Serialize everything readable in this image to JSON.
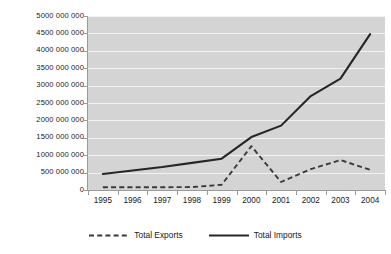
{
  "chart_data": {
    "type": "line",
    "title": "",
    "xlabel": "",
    "ylabel": "",
    "categories": [
      "1995",
      "1996",
      "1997",
      "1998",
      "1999",
      "2000",
      "2001",
      "2002",
      "2003",
      "2004"
    ],
    "series": [
      {
        "name": "Total Exports",
        "style": "dashed",
        "color": "#3a3a3a",
        "values": [
          80000000,
          80000000,
          80000000,
          85000000,
          150000000,
          1260000000,
          230000000,
          600000000,
          860000000,
          580000000
        ]
      },
      {
        "name": "Total Imports",
        "style": "solid",
        "color": "#262626",
        "values": [
          460000000,
          560000000,
          660000000,
          780000000,
          900000000,
          1520000000,
          1850000000,
          2700000000,
          3200000000,
          4480000000
        ]
      }
    ],
    "ylim": [
      0,
      5000000000
    ],
    "ytick_values": [
      0,
      500000000,
      1000000000,
      1500000000,
      2000000000,
      2500000000,
      3000000000,
      3500000000,
      4000000000,
      4500000000,
      5000000000
    ],
    "ytick_labels": [
      "0",
      "500 000 000",
      "1000 000 000",
      "1500 000 000",
      "2000 000 000",
      "2500 000 000",
      "3000 000 000",
      "3500 000 000",
      "4000 000 000",
      "4500 000 000",
      "5000 000 000"
    ],
    "grid": true,
    "grid_color": "#f2f2f2",
    "plot_background": "#d4d4d4",
    "legend_position": "bottom",
    "legend": [
      "Total Exports",
      "Total Imports"
    ]
  }
}
